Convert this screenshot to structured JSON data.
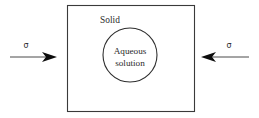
{
  "figure": {
    "name": "solid-with-aqueous-inclusion-under-stress",
    "background_color": "#ffffff",
    "width": 259,
    "height": 118
  },
  "labels": {
    "solid": "Solid",
    "aqueous_line1": "Aqueous",
    "aqueous_line2": "solution",
    "stress_left": "σ",
    "stress_right": "σ"
  },
  "shapes": {
    "solid_rect": {
      "label": "Solid",
      "x": 67,
      "y": 5,
      "width": 128,
      "height": 107,
      "stroke": "#3a3a3a",
      "fill": "none"
    },
    "aqueous_circle": {
      "label": "Aqueous solution",
      "cx": 130,
      "cy": 55,
      "r": 27,
      "stroke": "#2e2e2e",
      "fill": "none"
    }
  },
  "arrows": [
    {
      "name": "stress-arrow-left",
      "label": "σ",
      "direction": "right",
      "shaft_from_x": 10,
      "shaft_to_x": 46,
      "tip_x": 57,
      "y": 57,
      "color": "#0d0d0d"
    },
    {
      "name": "stress-arrow-right",
      "label": "σ",
      "direction": "left",
      "shaft_from_x": 249,
      "shaft_to_x": 213,
      "tip_x": 201,
      "y": 57,
      "color": "#0d0d0d"
    }
  ]
}
